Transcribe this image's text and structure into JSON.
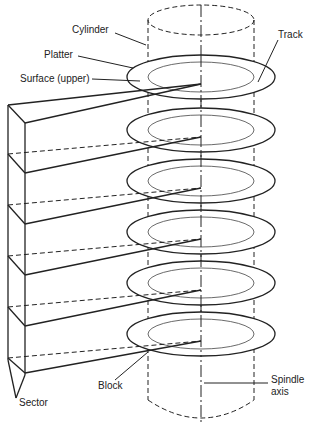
{
  "diagram": {
    "labels": {
      "cylinder": "Cylinder",
      "platter": "Platter",
      "surface": "Surface (upper)",
      "track": "Track",
      "block": "Block",
      "sector": "Sector",
      "spindle_line1": "Spindle",
      "spindle_line2": "axis"
    },
    "platter_count": 6,
    "colors": {
      "line": "#222222",
      "background": "#ffffff"
    }
  }
}
